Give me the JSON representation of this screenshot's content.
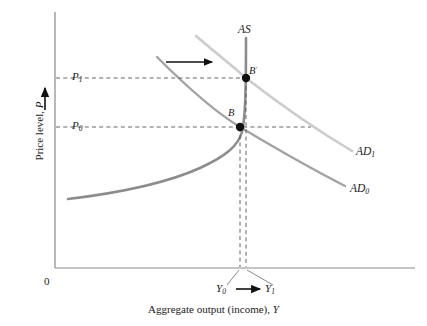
{
  "figure": {
    "title": "",
    "background_color": "#ffffff"
  },
  "axes": {
    "origin_label": "0",
    "y_axis_title_text": "Price level, ",
    "y_axis_title_var": "P",
    "x_axis_title_text": "Aggregate output (income), ",
    "x_axis_title_var": "Y",
    "axis_color": "#808080"
  },
  "price_ticks": [
    {
      "id": "p1",
      "base": "P",
      "sub": "1",
      "value_position_y": 78
    },
    {
      "id": "p0",
      "base": "P",
      "sub": "0",
      "value_position_y": 127
    }
  ],
  "output_ticks": [
    {
      "id": "y0",
      "base": "Y",
      "sub": "0",
      "value_position_x": 240
    },
    {
      "id": "y1",
      "base": "Y",
      "sub": "1",
      "value_position_x": 246
    }
  ],
  "curves": [
    {
      "id": "as",
      "label_base": "AS",
      "label_sub": "",
      "color": "#8c8c8c",
      "description": "aggregate supply, flat at low output then vertical at capacity"
    },
    {
      "id": "ad0",
      "label_base": "AD",
      "label_sub": "0",
      "color": "#a3a3a3",
      "description": "initial aggregate demand curve, downward sloping"
    },
    {
      "id": "ad1",
      "label_base": "AD",
      "label_sub": "1",
      "color": "#cccccc",
      "description": "shifted-right aggregate demand curve, downward sloping"
    }
  ],
  "points": [
    {
      "id": "b",
      "label_base": "B",
      "label_prime": "",
      "x": 240,
      "y": 127
    },
    {
      "id": "bprime",
      "label_base": "B",
      "label_prime": "'",
      "x": 246,
      "y": 78
    }
  ],
  "annotations": {
    "shift_arrow_label": "",
    "price_rise_arrow_label": "",
    "output_shift_arrow_label": ""
  },
  "colors": {
    "accent_dark": "#1a1a1a",
    "as_curve": "#8c8c8c",
    "ad0_curve": "#a3a3a3",
    "ad1_curve": "#cccccc",
    "dashed_guide": "#555555",
    "axis": "#808080"
  }
}
